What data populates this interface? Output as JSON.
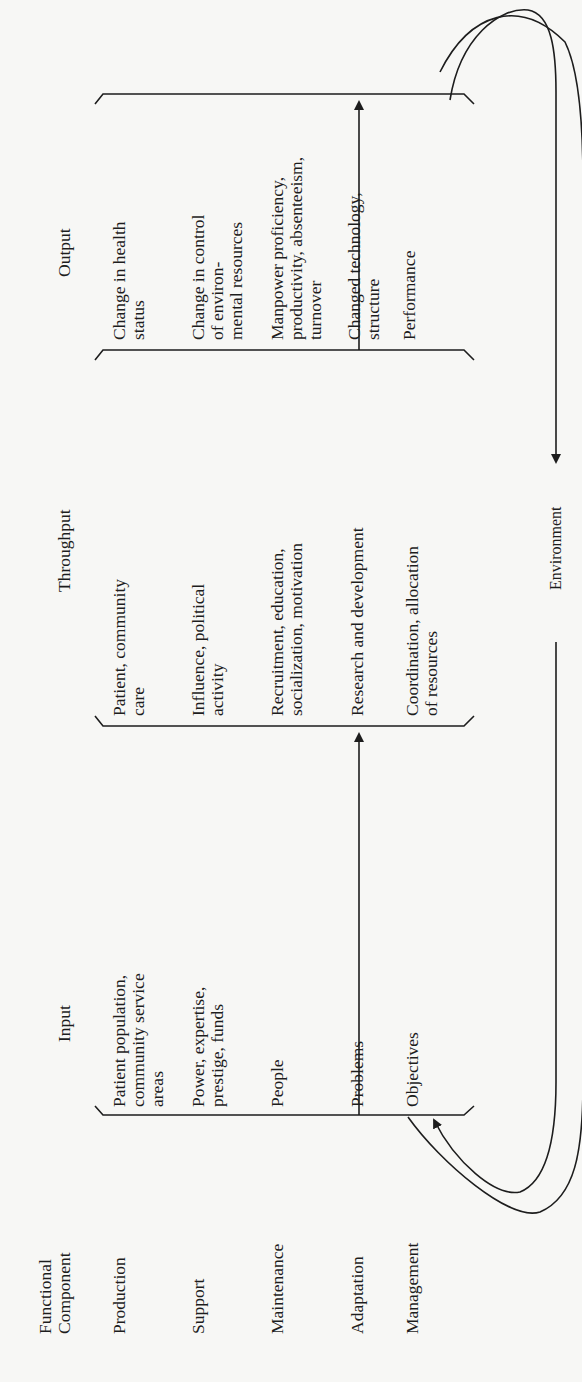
{
  "figure": {
    "orientation": "rotated-90-ccw",
    "headers": {
      "functional_component": [
        "Functional",
        "Component"
      ],
      "input": "Input",
      "throughput": "Throughput",
      "output": "Output"
    },
    "rows": [
      {
        "component": "Production",
        "input": [
          "Patient population,",
          "community service",
          "areas"
        ],
        "throughput": [
          "Patient, community",
          "care"
        ],
        "output": [
          "Change in health",
          "status"
        ]
      },
      {
        "component": "Support",
        "input": [
          "Power, expertise,",
          "prestige, funds"
        ],
        "throughput": [
          "Influence, political",
          "activity"
        ],
        "output": [
          "Change in control",
          "of environ-",
          "mental resources"
        ]
      },
      {
        "component": "Maintenance",
        "input": [
          "People"
        ],
        "throughput": [
          "Recruitment, education,",
          "socialization, motivation"
        ],
        "output": [
          "Manpower proficiency,",
          "productivity, absenteeism,",
          "turnover"
        ]
      },
      {
        "component": "Adaptation",
        "input": [
          "Problems"
        ],
        "throughput": [
          "Research and development"
        ],
        "output": [
          "Changed technology,",
          "structure"
        ]
      },
      {
        "component": "Management",
        "input": [
          "Objectives"
        ],
        "throughput": [
          "Coordination, allocation",
          "of resources"
        ],
        "output": [
          "Performance"
        ]
      }
    ],
    "feedback_label": "Environment"
  }
}
